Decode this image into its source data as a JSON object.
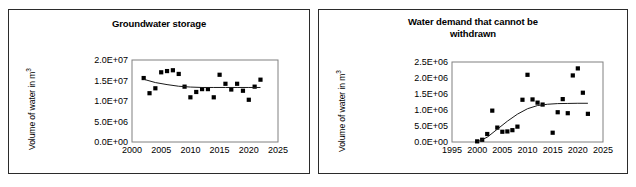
{
  "figure": {
    "panels": [
      "groundwater-storage",
      "water-demand-not-withdrawn"
    ]
  },
  "left": {
    "title": "Groundwater storage",
    "ylabel_prefix": "Volume of water in m",
    "ylabel_sup": "3",
    "ytick_labels": [
      "0.0E+00",
      "5.0E+06",
      "1.0E+07",
      "1.5E+07",
      "2.0E+07"
    ],
    "xtick_labels": [
      "2000",
      "2005",
      "2010",
      "2015",
      "2020",
      "2025"
    ]
  },
  "right": {
    "title_line1": "Water demand that cannot be",
    "title_line2": "withdrawn",
    "ylabel_prefix": "Volume of water in m",
    "ylabel_sup": "3",
    "ytick_labels": [
      "0.0E+00",
      "5.0E+05",
      "1.0E+06",
      "1.5E+06",
      "2.0E+06",
      "2.5E+06"
    ],
    "xtick_labels": [
      "1995",
      "2000",
      "2005",
      "2010",
      "2015",
      "2020",
      "2025"
    ]
  },
  "chart_data": [
    {
      "type": "scatter",
      "title": "Groundwater storage",
      "xlabel": "",
      "ylabel": "Volume of water in m3",
      "xlim": [
        2000,
        2025
      ],
      "ylim": [
        0,
        20000000
      ],
      "xticks": [
        2000,
        2005,
        2010,
        2015,
        2020,
        2025
      ],
      "yticks": [
        0,
        5000000,
        10000000,
        15000000,
        20000000
      ],
      "ytick_labels": [
        "0.0E+00",
        "5.0E+06",
        "1.0E+07",
        "1.5E+07",
        "2.0E+07"
      ],
      "grid": false,
      "legend": false,
      "series": [
        {
          "name": "Groundwater storage",
          "marker": "square",
          "color": "#000000",
          "x": [
            2002,
            2003,
            2004,
            2005,
            2006,
            2007,
            2008,
            2009,
            2010,
            2011,
            2012,
            2013,
            2014,
            2015,
            2016,
            2017,
            2018,
            2019,
            2020,
            2021,
            2022
          ],
          "y": [
            15600000,
            11900000,
            13100000,
            17000000,
            17300000,
            17500000,
            16600000,
            13500000,
            10900000,
            12200000,
            12900000,
            12900000,
            10900000,
            16400000,
            14200000,
            12800000,
            14200000,
            12500000,
            10300000,
            13500000,
            15200000
          ]
        }
      ],
      "trendline": {
        "name": "polynomial-fit",
        "color": "#1a1a1a",
        "x": [
          2002,
          2004,
          2006,
          2008,
          2010,
          2012,
          2014,
          2016,
          2018,
          2020,
          2022
        ],
        "y": [
          15300000,
          14500000,
          14000000,
          13600000,
          13400000,
          13300000,
          13300000,
          13300000,
          13300000,
          13300000,
          13300000
        ]
      }
    },
    {
      "type": "scatter",
      "title": "Water demand that cannot be withdrawn",
      "xlabel": "",
      "ylabel": "Volume of water in m3",
      "xlim": [
        1995,
        2025
      ],
      "ylim": [
        0,
        2500000
      ],
      "xticks": [
        1995,
        2000,
        2005,
        2010,
        2015,
        2020,
        2025
      ],
      "yticks": [
        0,
        500000,
        1000000,
        1500000,
        2000000,
        2500000
      ],
      "ytick_labels": [
        "0.0E+00",
        "5.0E+05",
        "1.0E+06",
        "1.5E+06",
        "2.0E+06",
        "2.5E+06"
      ],
      "grid": false,
      "legend": false,
      "series": [
        {
          "name": "Water demand that cannot be withdrawn",
          "marker": "square",
          "color": "#000000",
          "x": [
            2000,
            2001,
            2002,
            2003,
            2004,
            2005,
            2006,
            2007,
            2008,
            2009,
            2010,
            2011,
            2012,
            2013,
            2015,
            2016,
            2017,
            2018,
            2019,
            2020,
            2021,
            2022
          ],
          "y": [
            20000,
            70000,
            250000,
            980000,
            450000,
            320000,
            330000,
            370000,
            480000,
            1320000,
            2100000,
            1330000,
            1230000,
            1170000,
            290000,
            930000,
            1340000,
            900000,
            2080000,
            2300000,
            1540000,
            880000
          ]
        }
      ],
      "trendline": {
        "name": "logarithmic-fit",
        "color": "#1a1a1a",
        "x": [
          2000,
          2002,
          2004,
          2006,
          2008,
          2010,
          2012,
          2014,
          2016,
          2018,
          2020,
          2022
        ],
        "y": [
          0,
          150000,
          400000,
          650000,
          870000,
          1040000,
          1140000,
          1180000,
          1200000,
          1205000,
          1210000,
          1210000
        ]
      }
    }
  ]
}
